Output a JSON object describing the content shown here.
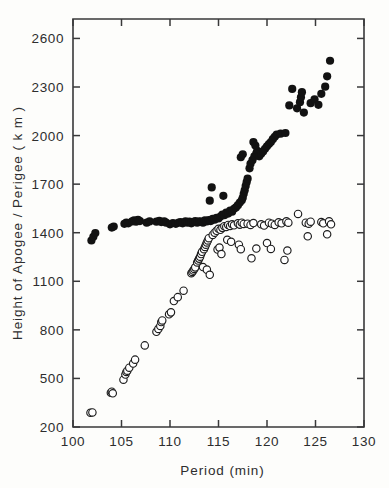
{
  "figure": {
    "background_color": "#fdfdfb",
    "frame_color": "#39393a"
  },
  "chart_data": {
    "type": "scatter",
    "title": "",
    "xlabel": "Period (min)",
    "ylabel": "Height of Apogee / Perigee ( k m )",
    "xlim": [
      100,
      130
    ],
    "ylim": [
      200,
      2720
    ],
    "xticks": [
      100,
      105,
      110,
      115,
      120,
      125,
      130
    ],
    "xtick_labels": [
      "100",
      "105",
      "110",
      "115",
      "120",
      "125",
      "130"
    ],
    "yticks": [
      200,
      500,
      800,
      1100,
      1400,
      1700,
      2000,
      2300,
      2600
    ],
    "ytick_labels": [
      "200",
      "500",
      "800",
      "1100",
      "1400",
      "1700",
      "2000",
      "2300",
      "2600"
    ],
    "grid": false,
    "legend_position": "none",
    "series": [
      {
        "name": "Apogee",
        "marker": "filled-circle",
        "marker_color": "#121212",
        "marker_size": 5.0,
        "points": [
          [
            101.9,
            1352
          ],
          [
            102.1,
            1375
          ],
          [
            102.3,
            1398
          ],
          [
            104.0,
            1432
          ],
          [
            104.2,
            1438
          ],
          [
            105.3,
            1455
          ],
          [
            105.5,
            1462
          ],
          [
            105.7,
            1458
          ],
          [
            106.1,
            1470
          ],
          [
            106.3,
            1476
          ],
          [
            106.5,
            1468
          ],
          [
            106.7,
            1480
          ],
          [
            106.9,
            1472
          ],
          [
            107.6,
            1462
          ],
          [
            107.9,
            1470
          ],
          [
            108.6,
            1468
          ],
          [
            108.9,
            1474
          ],
          [
            109.1,
            1466
          ],
          [
            109.4,
            1470
          ],
          [
            109.6,
            1462
          ],
          [
            110.0,
            1452
          ],
          [
            110.3,
            1460
          ],
          [
            110.6,
            1455
          ],
          [
            110.9,
            1462
          ],
          [
            111.1,
            1466
          ],
          [
            111.3,
            1458
          ],
          [
            111.6,
            1470
          ],
          [
            111.8,
            1462
          ],
          [
            112.0,
            1468
          ],
          [
            112.2,
            1458
          ],
          [
            112.4,
            1466
          ],
          [
            112.6,
            1472
          ],
          [
            112.8,
            1462
          ],
          [
            113.0,
            1470
          ],
          [
            113.2,
            1468
          ],
          [
            113.4,
            1462
          ],
          [
            113.6,
            1476
          ],
          [
            113.8,
            1470
          ],
          [
            114.0,
            1478
          ],
          [
            114.2,
            1472
          ],
          [
            114.4,
            1486
          ],
          [
            114.6,
            1480
          ],
          [
            114.8,
            1492
          ],
          [
            115.0,
            1488
          ],
          [
            114.3,
            1680
          ],
          [
            114.1,
            1598
          ],
          [
            115.2,
            1500
          ],
          [
            115.4,
            1512
          ],
          [
            115.6,
            1508
          ],
          [
            115.8,
            1524
          ],
          [
            116.0,
            1518
          ],
          [
            116.2,
            1536
          ],
          [
            116.4,
            1530
          ],
          [
            116.6,
            1548
          ],
          [
            116.8,
            1556
          ],
          [
            115.5,
            1628
          ],
          [
            117.0,
            1570
          ],
          [
            117.2,
            1586
          ],
          [
            117.4,
            1600
          ],
          [
            117.5,
            1616
          ],
          [
            117.6,
            1640
          ],
          [
            117.7,
            1662
          ],
          [
            117.8,
            1688
          ],
          [
            117.9,
            1712
          ],
          [
            118.0,
            1734
          ],
          [
            117.3,
            1866
          ],
          [
            117.5,
            1884
          ],
          [
            118.2,
            1798
          ],
          [
            118.3,
            1826
          ],
          [
            118.5,
            1848
          ],
          [
            118.7,
            1872
          ],
          [
            118.9,
            1890
          ],
          [
            119.0,
            1906
          ],
          [
            118.6,
            1960
          ],
          [
            118.8,
            1938
          ],
          [
            119.2,
            1872
          ],
          [
            119.4,
            1888
          ],
          [
            119.6,
            1902
          ],
          [
            119.8,
            1918
          ],
          [
            120.0,
            1934
          ],
          [
            120.2,
            1948
          ],
          [
            120.4,
            1960
          ],
          [
            120.6,
            1978
          ],
          [
            120.8,
            1992
          ],
          [
            121.0,
            2006
          ],
          [
            121.4,
            2012
          ],
          [
            121.9,
            2016
          ],
          [
            122.3,
            2186
          ],
          [
            122.6,
            2288
          ],
          [
            123.1,
            2168
          ],
          [
            123.4,
            2206
          ],
          [
            123.5,
            2236
          ],
          [
            123.6,
            2268
          ],
          [
            123.8,
            2142
          ],
          [
            124.5,
            2200
          ],
          [
            124.9,
            2224
          ],
          [
            125.3,
            2190
          ],
          [
            125.6,
            2258
          ],
          [
            126.0,
            2302
          ],
          [
            126.2,
            2366
          ],
          [
            126.5,
            2462
          ]
        ]
      },
      {
        "name": "Perigee",
        "marker": "open-circle",
        "marker_color": "#1d1d1d",
        "marker_size": 4.6,
        "points": [
          [
            101.8,
            288
          ],
          [
            102.0,
            290
          ],
          [
            103.9,
            412
          ],
          [
            104.0,
            418
          ],
          [
            104.1,
            408
          ],
          [
            105.2,
            492
          ],
          [
            105.4,
            524
          ],
          [
            105.5,
            540
          ],
          [
            105.6,
            548
          ],
          [
            105.8,
            566
          ],
          [
            106.2,
            592
          ],
          [
            106.4,
            616
          ],
          [
            107.4,
            704
          ],
          [
            108.6,
            788
          ],
          [
            108.8,
            806
          ],
          [
            109.0,
            824
          ],
          [
            109.1,
            848
          ],
          [
            109.2,
            858
          ],
          [
            109.9,
            896
          ],
          [
            110.1,
            908
          ],
          [
            110.4,
            978
          ],
          [
            110.8,
            1002
          ],
          [
            111.4,
            1042
          ],
          [
            112.2,
            1150
          ],
          [
            112.3,
            1158
          ],
          [
            112.4,
            1166
          ],
          [
            112.5,
            1176
          ],
          [
            112.6,
            1186
          ],
          [
            112.8,
            1216
          ],
          [
            112.9,
            1228
          ],
          [
            113.0,
            1240
          ],
          [
            113.1,
            1252
          ],
          [
            113.2,
            1268
          ],
          [
            113.3,
            1282
          ],
          [
            113.5,
            1298
          ],
          [
            113.6,
            1312
          ],
          [
            113.7,
            1326
          ],
          [
            113.8,
            1340
          ],
          [
            113.9,
            1352
          ],
          [
            114.0,
            1366
          ],
          [
            113.4,
            1188
          ],
          [
            113.8,
            1172
          ],
          [
            114.1,
            1140
          ],
          [
            114.4,
            1386
          ],
          [
            114.6,
            1400
          ],
          [
            114.8,
            1412
          ],
          [
            115.0,
            1424
          ],
          [
            115.2,
            1418
          ],
          [
            115.4,
            1430
          ],
          [
            114.9,
            1296
          ],
          [
            115.1,
            1308
          ],
          [
            115.3,
            1268
          ],
          [
            115.6,
            1440
          ],
          [
            115.8,
            1436
          ],
          [
            116.0,
            1448
          ],
          [
            116.2,
            1442
          ],
          [
            116.4,
            1452
          ],
          [
            116.6,
            1446
          ],
          [
            115.9,
            1356
          ],
          [
            116.3,
            1344
          ],
          [
            117.0,
            1458
          ],
          [
            117.2,
            1450
          ],
          [
            117.4,
            1462
          ],
          [
            117.6,
            1454
          ],
          [
            117.1,
            1326
          ],
          [
            117.3,
            1298
          ],
          [
            118.0,
            1456
          ],
          [
            118.3,
            1448
          ],
          [
            118.6,
            1460
          ],
          [
            118.4,
            1242
          ],
          [
            118.9,
            1302
          ],
          [
            119.4,
            1452
          ],
          [
            119.7,
            1444
          ],
          [
            120.2,
            1462
          ],
          [
            120.5,
            1456
          ],
          [
            120.8,
            1448
          ],
          [
            120.0,
            1336
          ],
          [
            120.4,
            1300
          ],
          [
            121.2,
            1464
          ],
          [
            121.5,
            1458
          ],
          [
            122.0,
            1470
          ],
          [
            122.2,
            1462
          ],
          [
            121.8,
            1232
          ],
          [
            122.1,
            1290
          ],
          [
            123.2,
            1516
          ],
          [
            124.0,
            1462
          ],
          [
            124.3,
            1456
          ],
          [
            124.5,
            1468
          ],
          [
            124.2,
            1378
          ],
          [
            125.6,
            1466
          ],
          [
            125.8,
            1458
          ],
          [
            126.4,
            1470
          ],
          [
            126.6,
            1452
          ],
          [
            126.2,
            1390
          ]
        ]
      }
    ]
  }
}
